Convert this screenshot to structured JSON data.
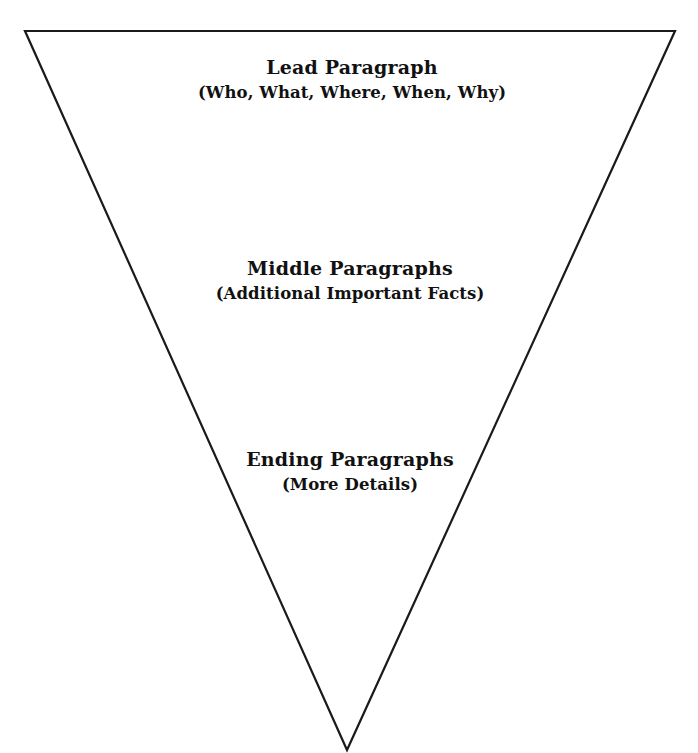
{
  "diagram": {
    "name": "inverted-pyramid",
    "shape": "inverted-triangle",
    "stroke_color": "#1a1a1a",
    "background_color": "#ffffff",
    "vertices": {
      "top_left": [
        25,
        31
      ],
      "top_right": [
        675,
        31
      ],
      "apex": [
        347,
        750
      ]
    },
    "blocks": [
      {
        "id": "lead",
        "title": "Lead Paragraph",
        "subtitle": "(Who, What, Where, When, Why)"
      },
      {
        "id": "middle",
        "title": "Middle Paragraphs",
        "subtitle": "(Additional Important Facts)"
      },
      {
        "id": "ending",
        "title": "Ending Paragraphs",
        "subtitle": "(More Details)"
      }
    ]
  }
}
